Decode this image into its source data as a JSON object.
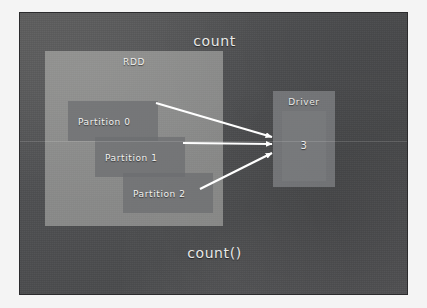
{
  "slide": {
    "title": "count",
    "caption": "count()",
    "background_color": "#4f5052",
    "page_margin_color": "#f4f4f4"
  },
  "rdd": {
    "label": "RDD",
    "panel_color": "#e0e0dc",
    "partitions": [
      {
        "label": "Partition 0"
      },
      {
        "label": "Partition 1"
      },
      {
        "label": "Partition 2"
      }
    ]
  },
  "driver": {
    "label": "Driver",
    "value": "3",
    "box_color": "#96989a"
  },
  "arrows": {
    "color": "#ffffff",
    "count": 3,
    "items": [
      {
        "from": "Partition 0",
        "to": "Driver"
      },
      {
        "from": "Partition 1",
        "to": "Driver"
      },
      {
        "from": "Partition 2",
        "to": "Driver"
      }
    ]
  }
}
